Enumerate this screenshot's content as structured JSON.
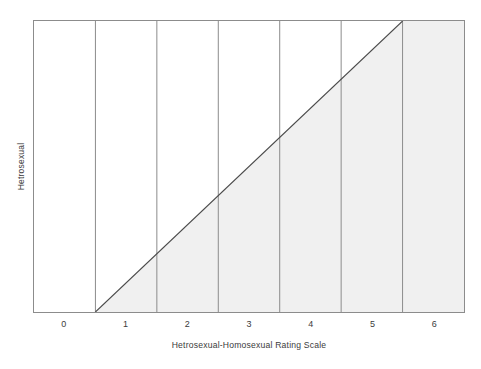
{
  "chart_data": {
    "type": "line",
    "title": "",
    "subtitle": "",
    "xlabel": "Hetrosexual-Homosexual Rating Scale",
    "ylabel_left": "Hetrosexual",
    "ylabel_right": "Homosexual",
    "categories": [
      "0",
      "1",
      "2",
      "3",
      "4",
      "5",
      "6"
    ],
    "x": [
      0,
      1,
      2,
      3,
      4,
      5,
      6
    ],
    "xlim": [
      -0.5,
      6.5
    ],
    "ylim": [
      0,
      1
    ],
    "grid": true,
    "grid_axis": "x",
    "legend": "none",
    "xtick_labels": [
      "0",
      "1",
      "2",
      "3",
      "4",
      "5",
      "6"
    ],
    "ytick_labels": [],
    "annotations": [],
    "series": [
      {
        "name": "Kinsey scale diagonal",
        "type": "line",
        "points": [
          {
            "x": 0.5,
            "y": 0
          },
          {
            "x": 5.5,
            "y": 1
          }
        ],
        "fill": "below-right",
        "fill_color": "#f0f0f0",
        "line_color": "#4a4a4a"
      }
    ],
    "colors": {
      "fill": "#f0f0f0",
      "line": "#4a4a4a",
      "grid": "#8c8c8c",
      "frame": "#8c8c8c",
      "text": "#3b3b3b",
      "background": "#ffffff"
    },
    "gridlines_x": [
      0.5,
      1.5,
      2.5,
      3.5,
      4.5,
      5.5
    ]
  },
  "axes": {
    "x_title": "Hetrosexual-Homosexual Rating Scale",
    "y_left_title": "Hetrosexual",
    "y_right_title": "Homosexual",
    "ticks": [
      {
        "label": "0",
        "value": 0
      },
      {
        "label": "1",
        "value": 1
      },
      {
        "label": "2",
        "value": 2
      },
      {
        "label": "3",
        "value": 3
      },
      {
        "label": "4",
        "value": 4
      },
      {
        "label": "5",
        "value": 5
      },
      {
        "label": "6",
        "value": 6
      }
    ]
  }
}
